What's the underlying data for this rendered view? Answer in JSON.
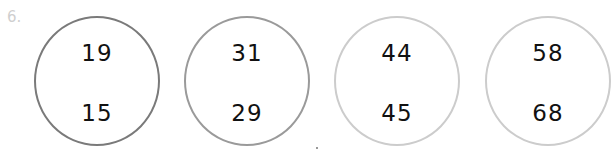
{
  "problem": {
    "number_label": "6."
  },
  "circles": [
    {
      "top": "19",
      "bottom": "15",
      "border_color": "#7a7a7a",
      "left": 34
    },
    {
      "top": "31",
      "bottom": "29",
      "border_color": "#9a9a9a",
      "left": 184
    },
    {
      "top": "44",
      "bottom": "45",
      "border_color": "#cccccc",
      "left": 334
    },
    {
      "top": "58",
      "bottom": "68",
      "border_color": "#cccccc",
      "left": 485
    }
  ]
}
